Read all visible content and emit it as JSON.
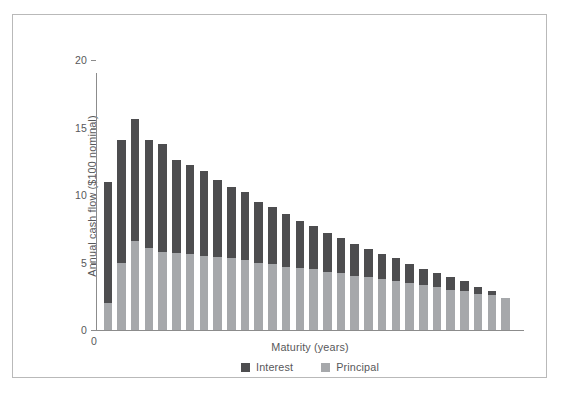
{
  "chart_data": {
    "type": "bar",
    "stacked": true,
    "title": "",
    "xlabel": "Maturity (years)",
    "ylabel": "Annual cash flow ($100 nominal)",
    "ylim": [
      0,
      20
    ],
    "yticks": [
      0,
      5,
      10,
      15,
      20
    ],
    "ytick_labels": [
      "0",
      "5",
      "10",
      "15",
      "20"
    ],
    "xtick_labels": [
      "0"
    ],
    "grid": false,
    "legend_position": "bottom-center",
    "x": [
      1,
      2,
      3,
      4,
      5,
      6,
      7,
      8,
      9,
      10,
      11,
      12,
      13,
      14,
      15,
      16,
      17,
      18,
      19,
      20,
      21,
      22,
      23,
      24,
      25,
      26,
      27,
      28,
      29,
      30
    ],
    "series": [
      {
        "name": "Principal",
        "color": "#a6a8ab",
        "values": [
          2.0,
          5.0,
          6.6,
          6.1,
          5.8,
          5.7,
          5.6,
          5.5,
          5.4,
          5.3,
          5.2,
          5.0,
          4.9,
          4.7,
          4.6,
          4.5,
          4.3,
          4.2,
          4.0,
          3.9,
          3.8,
          3.6,
          3.5,
          3.3,
          3.2,
          3.0,
          2.9,
          2.7,
          2.6,
          2.4
        ]
      },
      {
        "name": "Interest",
        "color": "#4d4d4f",
        "values": [
          9.0,
          9.1,
          9.0,
          8.0,
          8.0,
          6.9,
          6.6,
          6.3,
          5.7,
          5.3,
          5.0,
          4.5,
          4.2,
          3.9,
          3.5,
          3.2,
          2.9,
          2.6,
          2.4,
          2.1,
          1.8,
          1.7,
          1.4,
          1.2,
          1.0,
          0.9,
          0.7,
          0.5,
          0.3,
          0.0
        ]
      }
    ],
    "totals": [
      11.0,
      14.1,
      15.6,
      14.1,
      13.8,
      12.6,
      12.2,
      11.8,
      11.1,
      10.6,
      10.2,
      9.5,
      9.1,
      8.6,
      8.1,
      7.7,
      7.2,
      6.8,
      6.4,
      6.0,
      5.6,
      5.3,
      4.9,
      4.5,
      4.2,
      3.9,
      3.6,
      3.2,
      2.9,
      2.4
    ]
  },
  "legend": {
    "items": [
      {
        "label": "Interest",
        "key": "interest"
      },
      {
        "label": "Principal",
        "key": "principal"
      }
    ]
  },
  "axes": {
    "y_title": "Annual cash flow ($100 nominal)",
    "x_title": "Maturity (years)",
    "x_origin_label": "0"
  }
}
